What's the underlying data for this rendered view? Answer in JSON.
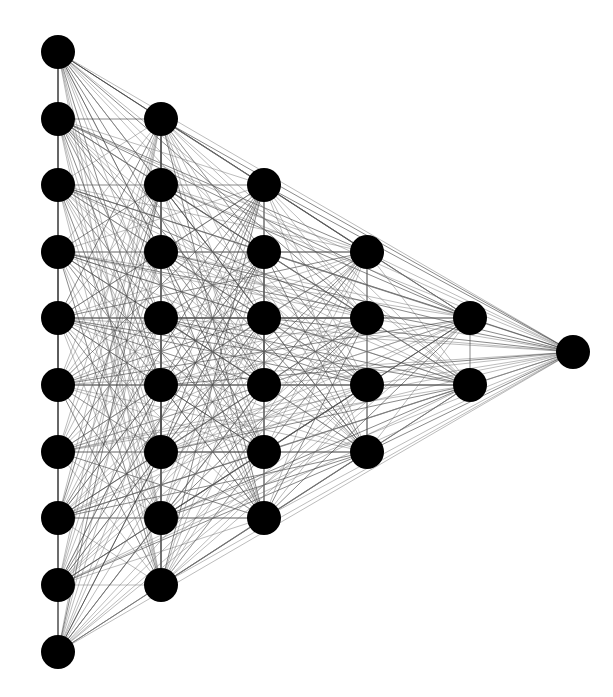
{
  "diagram": {
    "type": "fully-connected-network-graph",
    "canvas": {
      "width": 613,
      "height": 697,
      "background": "#ffffff"
    },
    "node_style": {
      "radius": 17,
      "fill": "#000000"
    },
    "edge_style": {
      "stroke": "#6a6a6a",
      "connectivity": "complete"
    },
    "layers": [
      {
        "name": "layer-1",
        "x": 58,
        "node_count": 10,
        "y": [
          52,
          119,
          185,
          252,
          318,
          385,
          452,
          518,
          585,
          652
        ]
      },
      {
        "name": "layer-2",
        "x": 161,
        "node_count": 8,
        "y": [
          119,
          185,
          252,
          318,
          385,
          452,
          518,
          585
        ]
      },
      {
        "name": "layer-3",
        "x": 264,
        "node_count": 6,
        "y": [
          185,
          252,
          318,
          385,
          452,
          518
        ]
      },
      {
        "name": "layer-4",
        "x": 367,
        "node_count": 4,
        "y": [
          252,
          318,
          385,
          452
        ]
      },
      {
        "name": "layer-5",
        "x": 470,
        "node_count": 2,
        "y": [
          318,
          385
        ]
      },
      {
        "name": "layer-6",
        "x": 573,
        "node_count": 1,
        "y": [
          352
        ]
      }
    ]
  }
}
